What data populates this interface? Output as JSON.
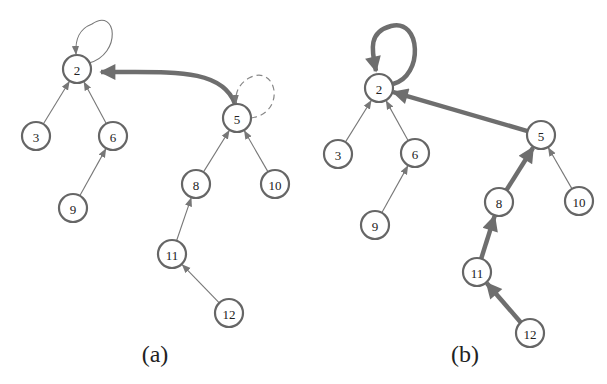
{
  "figure": {
    "panels": [
      {
        "id": "a",
        "caption": "(a)",
        "caption_pos": [
          155,
          362
        ],
        "nodes": [
          {
            "id": "2",
            "label": "2",
            "x": 77,
            "y": 69
          },
          {
            "id": "3",
            "label": "3",
            "x": 36,
            "y": 136
          },
          {
            "id": "6",
            "label": "6",
            "x": 113,
            "y": 136
          },
          {
            "id": "9",
            "label": "9",
            "x": 73,
            "y": 208
          },
          {
            "id": "5",
            "label": "5",
            "x": 237,
            "y": 118
          },
          {
            "id": "8",
            "label": "8",
            "x": 196,
            "y": 184
          },
          {
            "id": "10",
            "label": "10",
            "x": 275,
            "y": 184
          },
          {
            "id": "11",
            "label": "11",
            "x": 172,
            "y": 254
          },
          {
            "id": "12",
            "label": "12",
            "x": 229,
            "y": 313
          }
        ],
        "edges": [
          {
            "from": "3",
            "to": "2",
            "style": "thin"
          },
          {
            "from": "6",
            "to": "2",
            "style": "thin"
          },
          {
            "from": "9",
            "to": "6",
            "style": "thin"
          },
          {
            "from": "8",
            "to": "5",
            "style": "thin"
          },
          {
            "from": "10",
            "to": "5",
            "style": "thin"
          },
          {
            "from": "11",
            "to": "8",
            "style": "thin"
          },
          {
            "from": "12",
            "to": "11",
            "style": "thin"
          },
          {
            "from": "5",
            "to": "2",
            "style": "thick-curved"
          },
          {
            "from": "2",
            "to": "2",
            "style": "thin-selfloop"
          },
          {
            "from": "5",
            "to": "5",
            "style": "dashed-selfloop"
          }
        ]
      },
      {
        "id": "b",
        "caption": "(b)",
        "caption_pos": [
          465,
          362
        ],
        "nodes": [
          {
            "id": "2",
            "label": "2",
            "x": 379,
            "y": 88
          },
          {
            "id": "3",
            "label": "3",
            "x": 338,
            "y": 154
          },
          {
            "id": "6",
            "label": "6",
            "x": 415,
            "y": 153
          },
          {
            "id": "9",
            "label": "9",
            "x": 375,
            "y": 225
          },
          {
            "id": "5",
            "label": "5",
            "x": 541,
            "y": 135
          },
          {
            "id": "8",
            "label": "8",
            "x": 499,
            "y": 202
          },
          {
            "id": "10",
            "label": "10",
            "x": 579,
            "y": 201
          },
          {
            "id": "11",
            "label": "11",
            "x": 477,
            "y": 272
          },
          {
            "id": "12",
            "label": "12",
            "x": 530,
            "y": 333
          }
        ],
        "edges": [
          {
            "from": "3",
            "to": "2",
            "style": "thin"
          },
          {
            "from": "6",
            "to": "2",
            "style": "thin"
          },
          {
            "from": "9",
            "to": "6",
            "style": "thin"
          },
          {
            "from": "10",
            "to": "5",
            "style": "thin"
          },
          {
            "from": "8",
            "to": "5",
            "style": "thick"
          },
          {
            "from": "11",
            "to": "8",
            "style": "thick"
          },
          {
            "from": "12",
            "to": "11",
            "style": "thick"
          },
          {
            "from": "5",
            "to": "2",
            "style": "thick"
          },
          {
            "from": "2",
            "to": "2",
            "style": "thick-selfloop"
          }
        ]
      }
    ],
    "colors": {
      "node_stroke": "#666666",
      "edge": "#6e6e6e",
      "text": "#222222",
      "background": "#ffffff"
    }
  }
}
